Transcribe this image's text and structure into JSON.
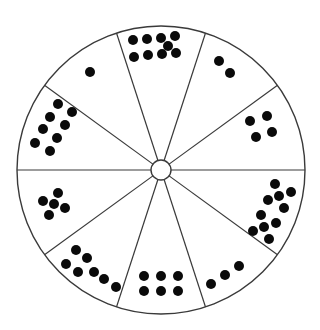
{
  "diagram": {
    "type": "dot-wheel",
    "center": [
      161,
      170
    ],
    "radius": 144,
    "hub_radius": 10,
    "colors": {
      "line": "#3a3a3a",
      "dot": "#0a0a0a",
      "background": "#ffffff"
    },
    "dot_radius": 5,
    "spoke_angles_deg": [
      0,
      36,
      72,
      108,
      144,
      180,
      216,
      252,
      288,
      324
    ],
    "sectors": [
      {
        "position": "top",
        "count": 9,
        "dots": [
          [
            133,
            40
          ],
          [
            147,
            39
          ],
          [
            161,
            38
          ],
          [
            175,
            36
          ],
          [
            168,
            46
          ],
          [
            134,
            57
          ],
          [
            148,
            55
          ],
          [
            162,
            54
          ],
          [
            176,
            53
          ]
        ]
      },
      {
        "position": "upper-right",
        "count": 2,
        "dots": [
          [
            219,
            61
          ],
          [
            230,
            73
          ]
        ]
      },
      {
        "position": "right-upper",
        "count": 4,
        "dots": [
          [
            250,
            121
          ],
          [
            267,
            116
          ],
          [
            272,
            132
          ],
          [
            256,
            137
          ]
        ]
      },
      {
        "position": "right-lower",
        "count": 10,
        "dots": [
          [
            275,
            184
          ],
          [
            291,
            192
          ],
          [
            279,
            196
          ],
          [
            268,
            200
          ],
          [
            284,
            208
          ],
          [
            261,
            215
          ],
          [
            276,
            223
          ],
          [
            264,
            227
          ],
          [
            253,
            231
          ],
          [
            269,
            239
          ]
        ]
      },
      {
        "position": "lower-right",
        "count": 3,
        "dots": [
          [
            211,
            284
          ],
          [
            225,
            275
          ],
          [
            239,
            266
          ]
        ]
      },
      {
        "position": "bottom",
        "count": 6,
        "dots": [
          [
            144,
            276
          ],
          [
            161,
            276
          ],
          [
            178,
            276
          ],
          [
            144,
            291
          ],
          [
            161,
            291
          ],
          [
            178,
            291
          ]
        ]
      },
      {
        "position": "lower-left",
        "count": 7,
        "dots": [
          [
            76,
            250
          ],
          [
            87,
            258
          ],
          [
            66,
            264
          ],
          [
            78,
            272
          ],
          [
            94,
            272
          ],
          [
            104,
            279
          ],
          [
            116,
            287
          ]
        ]
      },
      {
        "position": "left-lower",
        "count": 5,
        "dots": [
          [
            58,
            193
          ],
          [
            43,
            201
          ],
          [
            54,
            204
          ],
          [
            65,
            208
          ],
          [
            49,
            215
          ]
        ]
      },
      {
        "position": "left-upper",
        "count": 8,
        "dots": [
          [
            58,
            104
          ],
          [
            72,
            112
          ],
          [
            50,
            117
          ],
          [
            65,
            125
          ],
          [
            43,
            129
          ],
          [
            57,
            138
          ],
          [
            35,
            143
          ],
          [
            50,
            151
          ]
        ]
      },
      {
        "position": "upper-left",
        "count": 1,
        "dots": [
          [
            90,
            72
          ]
        ]
      }
    ]
  }
}
